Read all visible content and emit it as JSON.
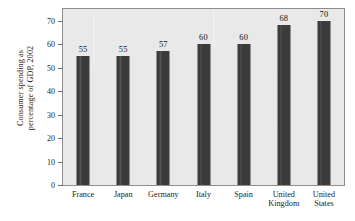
{
  "chart_data": {
    "type": "bar",
    "title": "",
    "subtitle": "",
    "xlabel": "",
    "ylabel": "Consumer spending as\npercentage of GDP, 2002",
    "categories": [
      "France",
      "Japan",
      "Germany",
      "Italy",
      "Spain",
      "United\nKingdom",
      "United\nStates"
    ],
    "values": [
      55,
      55,
      57,
      60,
      60,
      68,
      70
    ],
    "value_labels": [
      "55",
      "55",
      "57",
      "60",
      "60",
      "68",
      "70"
    ],
    "ylim": [
      0,
      75
    ],
    "yticks": [
      0,
      10,
      20,
      30,
      40,
      50,
      60,
      70
    ],
    "ytick_labels": [
      "0",
      "10",
      "20",
      "30",
      "40",
      "50",
      "60",
      "70"
    ],
    "grid": false,
    "legend": null,
    "bar_color": "#3b3b3b",
    "plot_background": "#e9e9e9",
    "figure_background": "#ffffff",
    "axis_color": "#8d8d8d",
    "text_color": "#1d1d1d"
  }
}
